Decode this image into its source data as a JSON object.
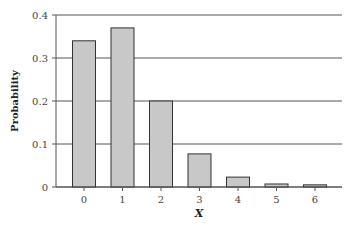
{
  "chart_data": {
    "type": "bar",
    "title": "",
    "xlabel": "X",
    "ylabel": "Probability",
    "categories": [
      "0",
      "1",
      "2",
      "3",
      "4",
      "5",
      "6"
    ],
    "values": [
      0.34,
      0.37,
      0.2,
      0.077,
      0.023,
      0.007,
      0.005
    ],
    "ylim": [
      0,
      0.4
    ],
    "yticks": [
      "0",
      "0.1",
      "0.2",
      "0.3",
      "0.4"
    ],
    "grid": true,
    "bar_color": "#c8c8c8"
  }
}
